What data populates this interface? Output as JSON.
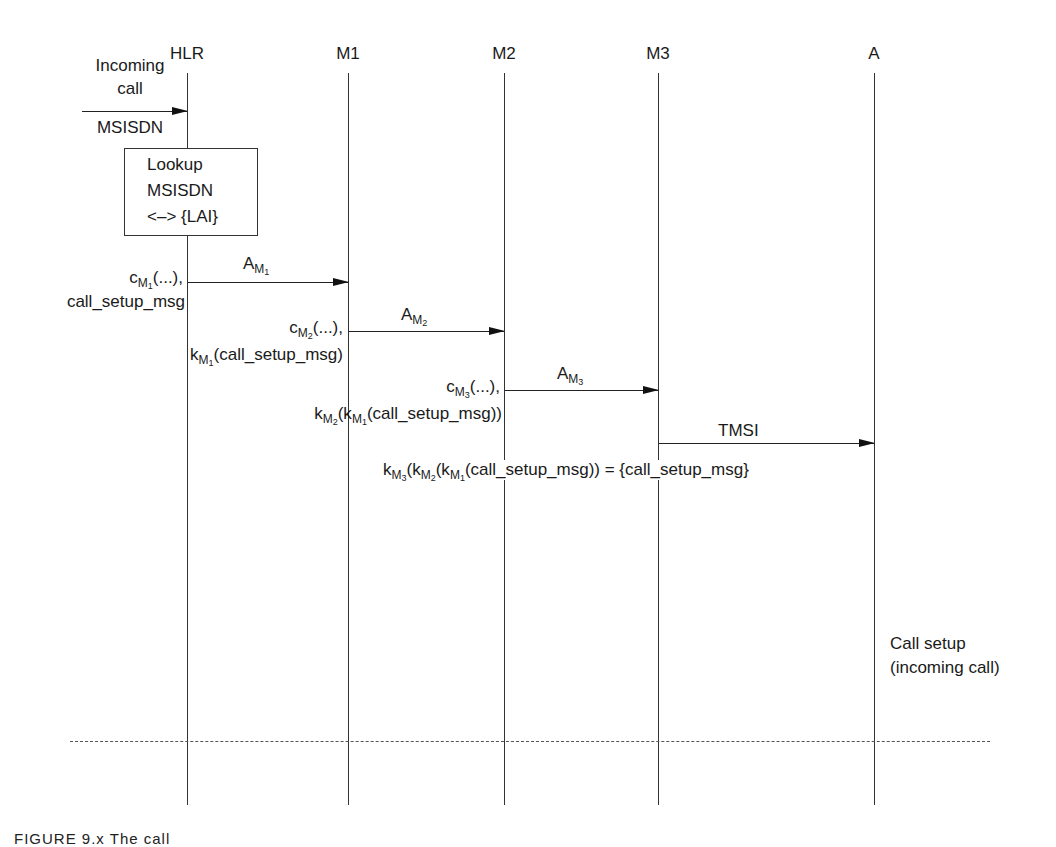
{
  "diagram": {
    "type": "sequence",
    "lifelines": [
      {
        "id": "hlr",
        "label": "HLR",
        "x": 187
      },
      {
        "id": "m1",
        "label": "M1",
        "x": 348
      },
      {
        "id": "m2",
        "label": "M2",
        "x": 504
      },
      {
        "id": "m3",
        "label": "M3",
        "x": 658
      },
      {
        "id": "a",
        "label": "A",
        "x": 874
      }
    ],
    "incoming": {
      "line1": "Incoming",
      "line2": "call",
      "line3": "MSISDN"
    },
    "lookup_box": {
      "line1": "Lookup",
      "line2": "MSISDN",
      "line3": "<–> {LAI}"
    },
    "messages": [
      {
        "from": "HLR",
        "to": "M1",
        "label_base": "A",
        "label_sub": "M",
        "label_subsub": "1",
        "left_line1_base": "c",
        "left_line1_sub": "M",
        "left_line1_subsub": "1",
        "left_line1_rest": "(...),",
        "left_line2": "call_setup_msg"
      },
      {
        "from": "M1",
        "to": "M2",
        "label_base": "A",
        "label_sub": "M",
        "label_subsub": "2",
        "left_line1_base": "c",
        "left_line1_sub": "M",
        "left_line1_subsub": "2",
        "left_line1_rest": "(...),",
        "left_line2_base": "k",
        "left_line2_sub": "M",
        "left_line2_subsub": "1",
        "left_line2_rest": "(call_setup_msg)"
      },
      {
        "from": "M2",
        "to": "M3",
        "label_base": "A",
        "label_sub": "M",
        "label_subsub": "3",
        "left_line1_base": "c",
        "left_line1_sub": "M",
        "left_line1_subsub": "3",
        "left_line1_rest": "(...),",
        "left_line2_k": "k",
        "left_line2_sub_a": "M",
        "left_line2_subsub_a": "2",
        "left_line2_mid": "(k",
        "left_line2_sub_b": "M",
        "left_line2_subsub_b": "1",
        "left_line2_rest": "(call_setup_msg))"
      },
      {
        "from": "M3",
        "to": "A",
        "label": "TMSI"
      }
    ],
    "result": {
      "k": "k",
      "sub3": "M",
      "subsub3": "3",
      "p1": "(k",
      "sub2": "M",
      "subsub2": "2",
      "p2": "(k",
      "sub1": "M",
      "subsub1": "1",
      "rest": "(call_setup_msg)) = {call_setup_msg}"
    },
    "phase_label": {
      "line1": "Call setup",
      "line2": "(incoming call)"
    },
    "caption": "FIGURE 9.x   The call"
  }
}
